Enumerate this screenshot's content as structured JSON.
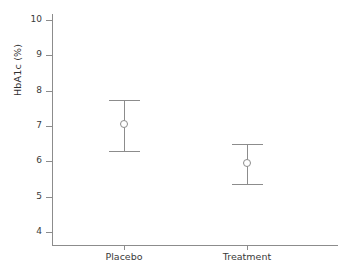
{
  "chart_data": {
    "type": "scatter",
    "title": "",
    "xlabel": "",
    "ylabel": "HbA1c (%)",
    "categories": [
      "Placebo",
      "Treatment"
    ],
    "values": [
      7.05,
      5.95
    ],
    "error_low": [
      6.3,
      5.35
    ],
    "error_high": [
      7.75,
      6.5
    ],
    "ylim": [
      3.65,
      10.4
    ],
    "yticks": [
      10,
      9,
      8,
      7,
      6,
      5,
      4
    ],
    "ytick_labels": [
      "10",
      "9",
      "8",
      "7",
      "6",
      "5",
      "4"
    ],
    "grid": false,
    "legend": "none",
    "series": [
      {
        "name": "HbA1c mean with 95% CI",
        "points": [
          {
            "category": "Placebo",
            "value": 7.05,
            "low": 6.3,
            "high": 7.75
          },
          {
            "category": "Treatment",
            "value": 5.95,
            "low": 5.35,
            "high": 6.5
          }
        ]
      }
    ],
    "marker": "open-circle",
    "colors": {
      "line": "#8c8c8c",
      "marker_edge": "#8c8c8c",
      "marker_face": "#ffffff",
      "axis": "#8c8c8c",
      "text": "#3a3a3a"
    }
  },
  "axes": {
    "y_title": "HbA1c (%)",
    "y_ticks": [
      {
        "label": "10",
        "value": 10
      },
      {
        "label": "9",
        "value": 9
      },
      {
        "label": "8",
        "value": 8
      },
      {
        "label": "7",
        "value": 7
      },
      {
        "label": "6",
        "value": 6
      },
      {
        "label": "5",
        "value": 5
      },
      {
        "label": "4",
        "value": 4
      }
    ],
    "x_ticks": [
      {
        "label": "Placebo"
      },
      {
        "label": "Treatment"
      }
    ]
  }
}
